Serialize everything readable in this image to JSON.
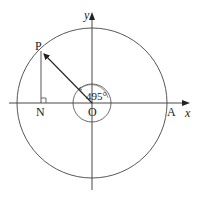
{
  "diagram": {
    "labels": {
      "point_p": "P",
      "point_n": "N",
      "origin": "O",
      "point_a": "A",
      "x_axis": "x",
      "y_axis": "y",
      "angle": "495°"
    },
    "geometry": {
      "origin": [
        92,
        103
      ],
      "large_circle_radius": 75,
      "small_circle_radius": 19,
      "point_p": [
        41,
        51
      ],
      "point_n": [
        41,
        103
      ],
      "point_a": [
        167,
        103
      ],
      "angle_degrees": 495
    },
    "colors": {
      "stroke": "#333333",
      "background": "#ffffff"
    }
  }
}
